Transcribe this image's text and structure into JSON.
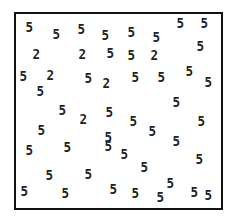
{
  "figure": {
    "glyphs": [
      {
        "char": "5",
        "x": 25,
        "y": 20
      },
      {
        "char": "5",
        "x": 52,
        "y": 27
      },
      {
        "char": "5",
        "x": 77,
        "y": 22
      },
      {
        "char": "5",
        "x": 101,
        "y": 28
      },
      {
        "char": "5",
        "x": 127,
        "y": 25
      },
      {
        "char": "5",
        "x": 152,
        "y": 30
      },
      {
        "char": "5",
        "x": 176,
        "y": 16
      },
      {
        "char": "5",
        "x": 200,
        "y": 16
      },
      {
        "char": "2",
        "x": 32,
        "y": 47
      },
      {
        "char": "2",
        "x": 78,
        "y": 47
      },
      {
        "char": "5",
        "x": 106,
        "y": 46
      },
      {
        "char": "5",
        "x": 127,
        "y": 48
      },
      {
        "char": "2",
        "x": 150,
        "y": 48
      },
      {
        "char": "5",
        "x": 196,
        "y": 39
      },
      {
        "char": "5",
        "x": 19,
        "y": 69
      },
      {
        "char": "2",
        "x": 46,
        "y": 68
      },
      {
        "char": "5",
        "x": 84,
        "y": 71
      },
      {
        "char": "2",
        "x": 102,
        "y": 76
      },
      {
        "char": "5",
        "x": 131,
        "y": 70
      },
      {
        "char": "5",
        "x": 157,
        "y": 70
      },
      {
        "char": "5",
        "x": 185,
        "y": 64
      },
      {
        "char": "5",
        "x": 36,
        "y": 84
      },
      {
        "char": "5",
        "x": 204,
        "y": 75
      },
      {
        "char": "5",
        "x": 58,
        "y": 103
      },
      {
        "char": "2",
        "x": 79,
        "y": 112
      },
      {
        "char": "5",
        "x": 105,
        "y": 105
      },
      {
        "char": "5",
        "x": 129,
        "y": 114
      },
      {
        "char": "5",
        "x": 172,
        "y": 95
      },
      {
        "char": "5",
        "x": 37,
        "y": 123
      },
      {
        "char": "5",
        "x": 148,
        "y": 124
      },
      {
        "char": "5",
        "x": 104,
        "y": 130
      },
      {
        "char": "5",
        "x": 197,
        "y": 114
      },
      {
        "char": "5",
        "x": 25,
        "y": 143
      },
      {
        "char": "5",
        "x": 63,
        "y": 140
      },
      {
        "char": "5",
        "x": 104,
        "y": 139
      },
      {
        "char": "5",
        "x": 120,
        "y": 147
      },
      {
        "char": "5",
        "x": 172,
        "y": 134
      },
      {
        "char": "5",
        "x": 195,
        "y": 152
      },
      {
        "char": "5",
        "x": 45,
        "y": 168
      },
      {
        "char": "5",
        "x": 84,
        "y": 167
      },
      {
        "char": "5",
        "x": 140,
        "y": 160
      },
      {
        "char": "5",
        "x": 166,
        "y": 176
      },
      {
        "char": "5",
        "x": 109,
        "y": 182
      },
      {
        "char": "5",
        "x": 20,
        "y": 184
      },
      {
        "char": "5",
        "x": 61,
        "y": 186
      },
      {
        "char": "5",
        "x": 131,
        "y": 186
      },
      {
        "char": "5",
        "x": 156,
        "y": 190
      },
      {
        "char": "5",
        "x": 190,
        "y": 185
      },
      {
        "char": "5",
        "x": 204,
        "y": 188
      }
    ]
  }
}
